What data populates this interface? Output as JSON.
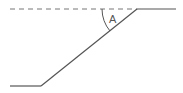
{
  "diagram": {
    "angle_label": "A",
    "colors": {
      "line": "#555555",
      "dashed": "#777777",
      "background": "#ffffff"
    }
  }
}
